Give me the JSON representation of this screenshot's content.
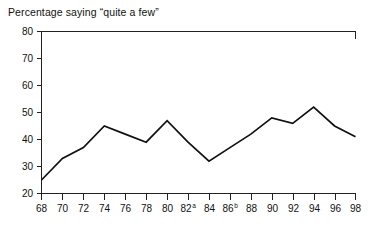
{
  "chart_data": {
    "type": "line",
    "title": "Percentage saying “quite a few”",
    "xlabel": "",
    "ylabel": "",
    "grid": false,
    "legend": "none",
    "xlim": [
      68,
      98
    ],
    "ylim": [
      20,
      80
    ],
    "ytick_step": 10,
    "xtick_step": 2,
    "yticks": [
      20,
      30,
      40,
      50,
      60,
      70,
      80
    ],
    "ytick_labels": [
      "20",
      "30",
      "40",
      "50",
      "60",
      "70",
      "80"
    ],
    "xticks": [
      68,
      70,
      72,
      74,
      76,
      78,
      80,
      82,
      84,
      86,
      88,
      90,
      92,
      94,
      96,
      98
    ],
    "xtick_labels": [
      "68",
      "70",
      "72",
      "74",
      "76",
      "78",
      "80",
      "82",
      "84",
      "86",
      "88",
      "90",
      "92",
      "94",
      "96",
      "98"
    ],
    "xtick_superscripts": {
      "82": "a",
      "86": "b"
    },
    "x": [
      68,
      70,
      72,
      74,
      76,
      78,
      80,
      82,
      84,
      86,
      88,
      90,
      92,
      94,
      96,
      98
    ],
    "values": [
      25,
      33,
      37,
      45,
      42,
      39,
      47,
      39,
      32,
      37,
      42,
      48,
      46,
      52,
      45,
      41
    ],
    "series": [
      {
        "name": "Percentage saying “quite a few”",
        "color": "#111111",
        "values": [
          25,
          33,
          37,
          45,
          42,
          39,
          47,
          39,
          32,
          37,
          42,
          48,
          46,
          52,
          45,
          41
        ]
      }
    ]
  },
  "axes": {
    "y_axis_name": "percentage-axis",
    "x_axis_name": "year-axis"
  }
}
